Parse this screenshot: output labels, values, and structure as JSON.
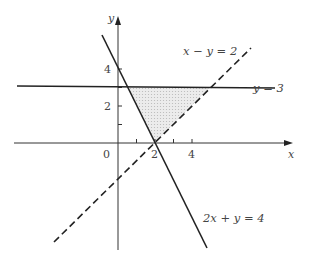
{
  "diagram": {
    "type": "linear-inequality-region",
    "axes": {
      "x_label": "x",
      "y_label": "y",
      "origin_label": "0",
      "x_tick_labels": [
        "2",
        "4"
      ],
      "y_tick_labels": [
        "2",
        "4"
      ]
    },
    "lines": [
      {
        "equation": "x − y = 2",
        "style": "dashed"
      },
      {
        "equation": "y = 3",
        "style": "solid"
      },
      {
        "equation": "2x + y = 4",
        "style": "solid"
      }
    ],
    "shaded_region": {
      "description": "triangle bounded by y = 3, 2x + y = 4, and x − y = 2",
      "vertices": [
        [
          0.5,
          3
        ],
        [
          5,
          3
        ],
        [
          2,
          0
        ]
      ]
    },
    "colors": {
      "line": "#222222",
      "axis": "#333333",
      "shade": "#d9d9d9",
      "text": "#444444"
    }
  }
}
